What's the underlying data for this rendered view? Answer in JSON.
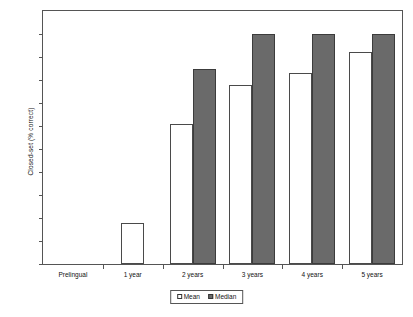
{
  "chart_data": {
    "type": "bar",
    "title": "",
    "xlabel": "",
    "ylabel": "Closed-set (% correct)",
    "ylim": [
      0,
      110
    ],
    "ytick_step": 10,
    "yticks": [
      0,
      10,
      20,
      30,
      40,
      50,
      60,
      70,
      80,
      90,
      100,
      110
    ],
    "grid": false,
    "legend_position": "bottom-center",
    "categories": [
      "Prelingual",
      "1 year",
      "2 years",
      "3 years",
      "4 years",
      "5 years"
    ],
    "series": [
      {
        "name": "Mean",
        "color": "#ffffff",
        "values": [
          0,
          18,
          61,
          78,
          83,
          92
        ]
      },
      {
        "name": "Median",
        "color": "#6a6a6a",
        "values": [
          0,
          0,
          85,
          100,
          100,
          100
        ]
      }
    ]
  },
  "colors": {
    "mean_fill": "#ffffff",
    "median_fill": "#6a6a6a",
    "axis": "#555555",
    "text": "#111111"
  }
}
